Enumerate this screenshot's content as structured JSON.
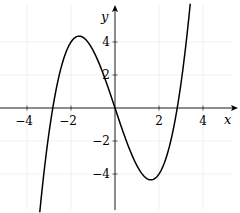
{
  "chart_data": {
    "type": "line",
    "title": "",
    "xlabel": "x",
    "ylabel": "y",
    "function": "y = 0.5x^3 - 4x",
    "xlim": [
      -5,
      5.2
    ],
    "ylim": [
      -6.1,
      6.1
    ],
    "grid": true,
    "x_ticks": [
      -4,
      -2,
      2,
      4
    ],
    "y_ticks": [
      -4,
      -2,
      2,
      4
    ],
    "x_tick_labels": [
      "−4",
      "−2",
      "2",
      "4"
    ],
    "y_tick_labels": [
      "−4",
      "−2",
      "2",
      "4"
    ],
    "series": [
      {
        "name": "curve",
        "x": [
          -3.4,
          -3,
          -2.83,
          -2.5,
          -2,
          -1.63,
          -1,
          -0.5,
          0,
          0.5,
          1,
          1.63,
          2,
          2.5,
          2.83,
          3,
          3.4
        ],
        "y": [
          -6.05,
          -1.5,
          0,
          2.19,
          4,
          4.35,
          3.5,
          1.94,
          0,
          -1.94,
          -3.5,
          -4.35,
          -4,
          -2.19,
          0,
          1.5,
          6.05
        ]
      }
    ],
    "features": {
      "roots": [
        -2.83,
        0,
        2.83
      ],
      "local_max": [
        -1.63,
        4.35
      ],
      "local_min": [
        1.63,
        -4.35
      ]
    }
  },
  "axes": {
    "x_label": "x",
    "y_label": "y"
  },
  "ticks": {
    "x": [
      {
        "v": -4,
        "label": "−4"
      },
      {
        "v": -2,
        "label": "−2"
      },
      {
        "v": 2,
        "label": "2"
      },
      {
        "v": 4,
        "label": "4"
      }
    ],
    "y": [
      {
        "v": 4,
        "label": "4"
      },
      {
        "v": 2,
        "label": "2"
      },
      {
        "v": -2,
        "label": "−2"
      },
      {
        "v": -4,
        "label": "−4"
      }
    ]
  },
  "colors": {
    "curve": "#000000",
    "grid": "#e6e6e6",
    "axis": "#000000"
  }
}
